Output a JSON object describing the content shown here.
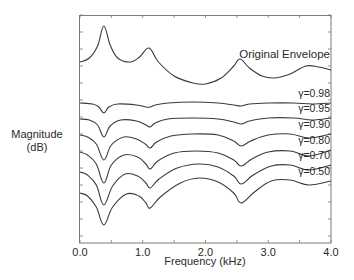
{
  "chart_data": {
    "type": "line",
    "title": "",
    "xlabel": "Frequency (kHz)",
    "ylabel_lines": [
      "Magnitude",
      "(dB)"
    ],
    "xlim": [
      0.0,
      4.0
    ],
    "ylim": [
      -114,
      0
    ],
    "x_ticks": [
      0.0,
      1.0,
      2.0,
      3.0,
      4.0
    ],
    "x_tick_labels": [
      "0.0",
      "1.0",
      "2.0",
      "3.0",
      "4.0"
    ],
    "x_minor_step": 0.5,
    "y_tick_labels_visible": false,
    "y_tick_step": 8.5,
    "grid": false,
    "legend": "inline-right",
    "series": [
      {
        "name": "Original Envelope",
        "label": "Original Envelope",
        "x": [
          0.0,
          0.15,
          0.28,
          0.38,
          0.48,
          0.6,
          0.8,
          0.95,
          1.1,
          1.25,
          1.5,
          1.8,
          2.0,
          2.25,
          2.45,
          2.55,
          2.7,
          2.9,
          3.1,
          3.35,
          3.6,
          3.8,
          4.0
        ],
        "y": [
          -23.5,
          -21.5,
          -15.5,
          -5.5,
          -15,
          -21.5,
          -23.5,
          -21,
          -16.5,
          -23.5,
          -30.5,
          -34,
          -34.5,
          -31.5,
          -25.5,
          -22,
          -26.5,
          -30.5,
          -31.5,
          -29.5,
          -25.5,
          -26,
          -27.5
        ]
      },
      {
        "name": "gamma=0.98",
        "label": "γ=0.98",
        "x": [
          0.0,
          0.2,
          0.3,
          0.38,
          0.46,
          0.6,
          0.9,
          1.05,
          1.12,
          1.2,
          1.4,
          1.8,
          2.2,
          2.45,
          2.57,
          2.7,
          3.0,
          3.4,
          3.7,
          4.0
        ],
        "y": [
          -44,
          -44.5,
          -46,
          -49,
          -46,
          -44.5,
          -45,
          -46,
          -46,
          -45,
          -44,
          -43.5,
          -44,
          -45,
          -45.5,
          -44.5,
          -44,
          -44,
          -44.5,
          -44
        ]
      },
      {
        "name": "gamma=0.95",
        "label": "γ=0.95",
        "x": [
          0.0,
          0.15,
          0.28,
          0.38,
          0.48,
          0.65,
          0.9,
          1.05,
          1.12,
          1.2,
          1.4,
          1.8,
          2.2,
          2.45,
          2.57,
          2.7,
          3.0,
          3.4,
          3.7,
          4.0
        ],
        "y": [
          -52,
          -52.5,
          -55,
          -61,
          -55.5,
          -52.5,
          -53,
          -55,
          -56,
          -54,
          -52,
          -51.5,
          -52,
          -53.5,
          -54.5,
          -53,
          -51.5,
          -51.5,
          -52.5,
          -51.5
        ]
      },
      {
        "name": "gamma=0.90",
        "label": "γ=0.90",
        "x": [
          0.0,
          0.12,
          0.26,
          0.38,
          0.5,
          0.7,
          0.9,
          1.04,
          1.12,
          1.22,
          1.45,
          1.8,
          2.2,
          2.45,
          2.57,
          2.72,
          3.0,
          3.35,
          3.65,
          4.0
        ],
        "y": [
          -60,
          -61,
          -64.5,
          -72.5,
          -65,
          -61,
          -62,
          -64.5,
          -66.5,
          -63.5,
          -60.5,
          -59.5,
          -60,
          -63,
          -65.5,
          -63,
          -60,
          -59.5,
          -61.5,
          -59.5
        ]
      },
      {
        "name": "gamma=0.80",
        "label": "γ=0.80",
        "x": [
          0.0,
          0.12,
          0.26,
          0.38,
          0.5,
          0.7,
          0.92,
          1.05,
          1.12,
          1.24,
          1.5,
          1.85,
          2.2,
          2.45,
          2.57,
          2.74,
          3.0,
          3.35,
          3.65,
          4.0
        ],
        "y": [
          -68.5,
          -70,
          -74.5,
          -84,
          -75,
          -70,
          -71,
          -74.5,
          -77,
          -73,
          -69,
          -68,
          -69,
          -72.5,
          -75.5,
          -72,
          -68.5,
          -68,
          -70.5,
          -67.5
        ]
      },
      {
        "name": "gamma=0.70",
        "label": "γ=0.70",
        "x": [
          0.0,
          0.12,
          0.26,
          0.38,
          0.52,
          0.72,
          0.92,
          1.05,
          1.12,
          1.26,
          1.55,
          1.9,
          2.2,
          2.45,
          2.57,
          2.76,
          3.05,
          3.35,
          3.65,
          4.0
        ],
        "y": [
          -78.5,
          -80,
          -85,
          -95,
          -85.5,
          -79.5,
          -80.5,
          -84,
          -86.5,
          -82,
          -76.5,
          -74.5,
          -76,
          -80.5,
          -84.5,
          -80,
          -75.5,
          -75,
          -77.5,
          -75
        ]
      },
      {
        "name": "gamma=0.50",
        "label": "γ=0.50",
        "x": [
          0.0,
          0.12,
          0.26,
          0.38,
          0.52,
          0.74,
          0.94,
          1.05,
          1.12,
          1.28,
          1.6,
          1.9,
          2.2,
          2.45,
          2.57,
          2.78,
          3.05,
          3.35,
          3.65,
          4.0
        ],
        "y": [
          -89,
          -90.5,
          -96,
          -105,
          -96,
          -89.5,
          -90.5,
          -94,
          -96.5,
          -91,
          -84,
          -81.5,
          -83.5,
          -89,
          -94,
          -88.5,
          -83,
          -82.5,
          -85,
          -83
        ]
      }
    ]
  }
}
